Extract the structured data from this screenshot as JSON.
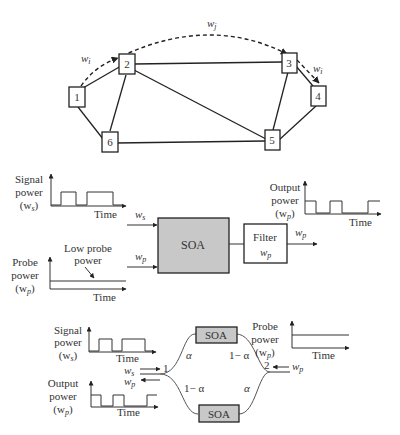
{
  "network": {
    "nodes": [
      {
        "id": "1",
        "x": 78,
        "y": 97
      },
      {
        "id": "2",
        "x": 127,
        "y": 65
      },
      {
        "id": "3",
        "x": 289,
        "y": 63
      },
      {
        "id": "4",
        "x": 318,
        "y": 96
      },
      {
        "id": "5",
        "x": 272,
        "y": 140
      },
      {
        "id": "6",
        "x": 109,
        "y": 141
      }
    ],
    "links": [
      [
        "1",
        "2"
      ],
      [
        "1",
        "6"
      ],
      [
        "2",
        "3"
      ],
      [
        "2",
        "6"
      ],
      [
        "2",
        "5"
      ],
      [
        "3",
        "5"
      ],
      [
        "3",
        "4"
      ],
      [
        "4",
        "5"
      ],
      [
        "6",
        "5"
      ]
    ],
    "labels": {
      "wi_left": "w",
      "wi_left_sub": "i",
      "wj": "w",
      "wj_sub": "j",
      "wi_right": "w",
      "wi_right_sub": "i"
    }
  },
  "xgm": {
    "signal_label_1": "Signal",
    "signal_label_2": "power",
    "signal_label_3": "(w",
    "signal_label_3_sub": "s",
    "signal_label_3_end": ")",
    "time_label": "Time",
    "probe_label_1": "Probe",
    "probe_label_2": "power",
    "probe_label_3": "(w",
    "probe_label_3_sub": "p",
    "probe_label_3_end": ")",
    "low_probe_1": "Low probe",
    "low_probe_2": "power",
    "ws_label": "w",
    "ws_sub": "s",
    "wp_label": "w",
    "wp_sub": "p",
    "soa_label": "SOA",
    "filter_label": "Filter",
    "filter_w": "w",
    "filter_w_sub": "p",
    "out_w": "w",
    "out_w_sub": "p",
    "output_label_1": "Output",
    "output_label_2": "power",
    "output_label_3": "(w",
    "output_label_3_sub": "p",
    "output_label_3_end": ")"
  },
  "mzi": {
    "signal_label_1": "Signal",
    "signal_label_2": "power",
    "signal_label_3": "(w",
    "signal_label_3_sub": "s",
    "signal_label_3_end": ")",
    "output_label_1": "Output",
    "output_label_2": "power",
    "output_label_3": "(w",
    "output_label_3_sub": "p",
    "output_label_3_end": ")",
    "probe_label_1": "Probe",
    "probe_label_2": "power",
    "probe_label_3": "(w",
    "probe_label_3_sub": "p",
    "probe_label_3_end": ")",
    "time_label": "Time",
    "soa_top": "SOA",
    "soa_bottom": "SOA",
    "alpha": "α",
    "one_minus_alpha": "1− α",
    "port1": "1",
    "port2": "2",
    "ws_label": "w",
    "ws_sub": "s",
    "wp_label": "w",
    "wp_sub": "p",
    "wp_right_label": "w",
    "wp_right_sub": "p"
  }
}
